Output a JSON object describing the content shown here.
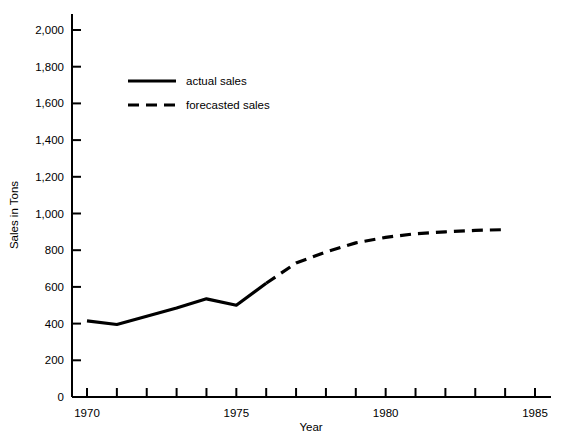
{
  "chart_data": {
    "type": "line",
    "title": "",
    "xlabel": "Year",
    "ylabel": "Sales in Tons",
    "xlim": [
      1970,
      1985
    ],
    "ylim": [
      0,
      2000
    ],
    "grid": false,
    "legend_position": "upper-left-inside",
    "x_ticks_major": [
      "1970",
      "1975",
      "1980",
      "1985"
    ],
    "x_tick_values_major": [
      1970,
      1975,
      1980,
      1985
    ],
    "x_tick_values_minor": [
      1971,
      1972,
      1973,
      1974,
      1976,
      1977,
      1978,
      1979,
      1981,
      1982,
      1983,
      1984
    ],
    "y_ticks": [
      "0",
      "200",
      "400",
      "600",
      "800",
      "1,000",
      "1,200",
      "1,400",
      "1,600",
      "1,800",
      "2,000"
    ],
    "y_tick_values": [
      0,
      200,
      400,
      600,
      800,
      1000,
      1200,
      1400,
      1600,
      1800,
      2000
    ],
    "series": [
      {
        "name": "actual sales",
        "style": "solid",
        "color": "#000000",
        "x": [
          1970,
          1971,
          1972,
          1973,
          1974,
          1975,
          1976
        ],
        "values": [
          415,
          395,
          440,
          485,
          535,
          500,
          620
        ]
      },
      {
        "name": "forecasted sales",
        "style": "dashed",
        "color": "#000000",
        "x": [
          1976,
          1977,
          1978,
          1979,
          1980,
          1981,
          1982,
          1983,
          1984
        ],
        "values": [
          620,
          730,
          790,
          840,
          870,
          890,
          900,
          908,
          912
        ]
      }
    ]
  },
  "legend": {
    "items": [
      {
        "label": "actual sales",
        "style": "solid"
      },
      {
        "label": "forecasted sales",
        "style": "dashed"
      }
    ]
  },
  "axes": {
    "x_title": "Year",
    "y_title": "Sales in Tons"
  },
  "colors": {
    "line": "#000000",
    "axis": "#000000",
    "background": "#ffffff"
  }
}
